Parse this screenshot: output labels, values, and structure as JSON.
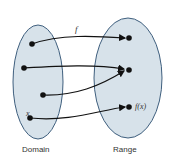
{
  "diagram": {
    "labels": {
      "function": "f",
      "element": "x",
      "image": "f(x)",
      "domain": "Domain",
      "range": "Range"
    },
    "colors": {
      "fill": "#d7e2ea",
      "stroke": "#3f5f7e",
      "arrow": "#111111"
    },
    "sets": [
      {
        "name": "Domain",
        "points": 4
      },
      {
        "name": "Range",
        "points": 3
      }
    ],
    "mappings": [
      {
        "from": "domain-point-1",
        "to": "range-point-1"
      },
      {
        "from": "domain-point-2",
        "to": "range-point-2"
      },
      {
        "from": "domain-point-3",
        "to": "range-point-2"
      },
      {
        "from": "domain-point-x",
        "to": "range-point-fx"
      }
    ]
  }
}
